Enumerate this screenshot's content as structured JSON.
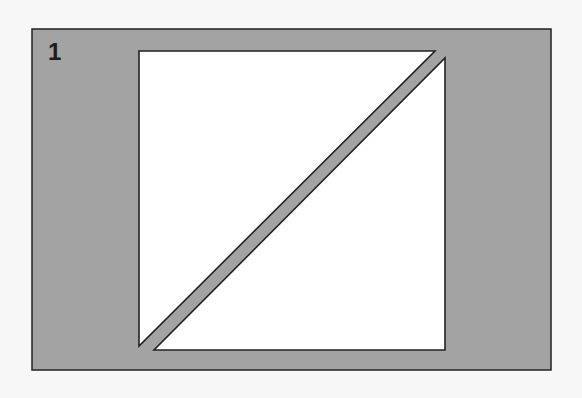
{
  "figure": {
    "label": "1",
    "colors": {
      "background": "#f7f7f7",
      "panel": "#a3a3a3",
      "shape_fill": "#ffffff",
      "stroke": "#222222"
    },
    "panel": {
      "x": 32,
      "y": 29,
      "w": 519,
      "h": 341
    },
    "shapes": [
      {
        "name": "upper-left-triangle",
        "points": "139,51 435,51 139,346"
      },
      {
        "name": "lower-right-triangle",
        "points": "445,58 445,350 154,350"
      }
    ]
  }
}
